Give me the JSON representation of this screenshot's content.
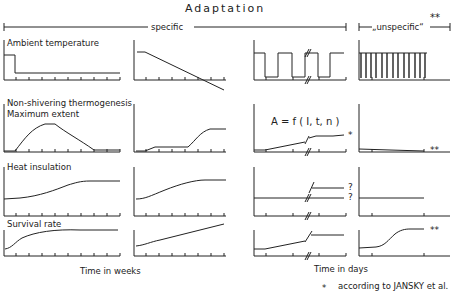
{
  "title": "Adaptation",
  "groups": {
    "specific": "specific",
    "unspecific": "„unspecific“",
    "unspecific_mark": "**"
  },
  "rows": [
    {
      "label": "Ambient temperature"
    },
    {
      "label": "Non-shivering thermogenesis",
      "label2": "Maximum extent"
    },
    {
      "label": "Heat insulation"
    },
    {
      "label": "Survival rate"
    }
  ],
  "formula": "A = f ( I, t, n )",
  "annotations": {
    "star": "*",
    "double_star": "**",
    "question_upper": "?",
    "question_lower": "?"
  },
  "x_axis_labels": {
    "weeks": "Time  in  weeks",
    "days": "Time  in  days"
  },
  "footnote": {
    "marker": "*",
    "text": "according to JANSKY et al."
  },
  "colors": {
    "ink": "#222222",
    "background": "#ffffff"
  }
}
